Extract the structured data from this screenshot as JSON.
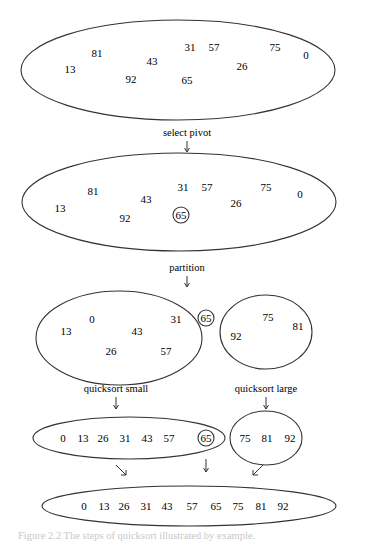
{
  "diagram": {
    "stage1": {
      "values": [
        {
          "v": "81",
          "x": 97,
          "y": 57
        },
        {
          "v": "13",
          "x": 70,
          "y": 73
        },
        {
          "v": "43",
          "x": 152,
          "y": 65
        },
        {
          "v": "92",
          "x": 131,
          "y": 83
        },
        {
          "v": "31",
          "x": 190,
          "y": 51
        },
        {
          "v": "57",
          "x": 214,
          "y": 51
        },
        {
          "v": "65",
          "x": 187,
          "y": 84
        },
        {
          "v": "26",
          "x": 242,
          "y": 70
        },
        {
          "v": "75",
          "x": 275,
          "y": 51
        },
        {
          "v": "0",
          "x": 306,
          "y": 59
        }
      ]
    },
    "labels": {
      "select_pivot": "select pivot",
      "partition": "partition",
      "quicksort_small": "quicksort small",
      "quicksort_large": "quicksort large"
    },
    "stage2": {
      "values": [
        {
          "v": "81",
          "x": 93,
          "y": 193
        },
        {
          "v": "13",
          "x": 60,
          "y": 210
        },
        {
          "v": "43",
          "x": 146,
          "y": 201
        },
        {
          "v": "92",
          "x": 125,
          "y": 220
        },
        {
          "v": "31",
          "x": 183,
          "y": 189
        },
        {
          "v": "57",
          "x": 207,
          "y": 189
        },
        {
          "v": "26",
          "x": 236,
          "y": 205
        },
        {
          "v": "75",
          "x": 266,
          "y": 189
        },
        {
          "v": "0",
          "x": 300,
          "y": 196
        }
      ],
      "pivot": {
        "v": "65",
        "x": 188,
        "y": 219
      }
    },
    "stage3": {
      "small": [
        {
          "v": "0",
          "x": 92,
          "y": 323
        },
        {
          "v": "13",
          "x": 66,
          "y": 335
        },
        {
          "v": "43",
          "x": 137,
          "y": 335
        },
        {
          "v": "31",
          "x": 176,
          "y": 323
        },
        {
          "v": "26",
          "x": 111,
          "y": 355
        },
        {
          "v": "57",
          "x": 166,
          "y": 355
        }
      ],
      "pivot": {
        "v": "65",
        "x": 206,
        "y": 320
      },
      "large": [
        {
          "v": "75",
          "x": 268,
          "y": 321
        },
        {
          "v": "81",
          "x": 298,
          "y": 330
        },
        {
          "v": "92",
          "x": 236,
          "y": 340
        }
      ]
    },
    "stage4": {
      "small_sorted": [
        "0",
        "13",
        "26",
        "31",
        "43",
        "57"
      ],
      "pivot": "65",
      "large_sorted": [
        "75",
        "81",
        "92"
      ]
    },
    "stage5": {
      "sorted": [
        "0",
        "13",
        "26",
        "31",
        "43",
        "57",
        "65",
        "75",
        "81",
        "92"
      ]
    },
    "caption": "Figure 2.2  The steps of quicksort illustrated by example."
  }
}
